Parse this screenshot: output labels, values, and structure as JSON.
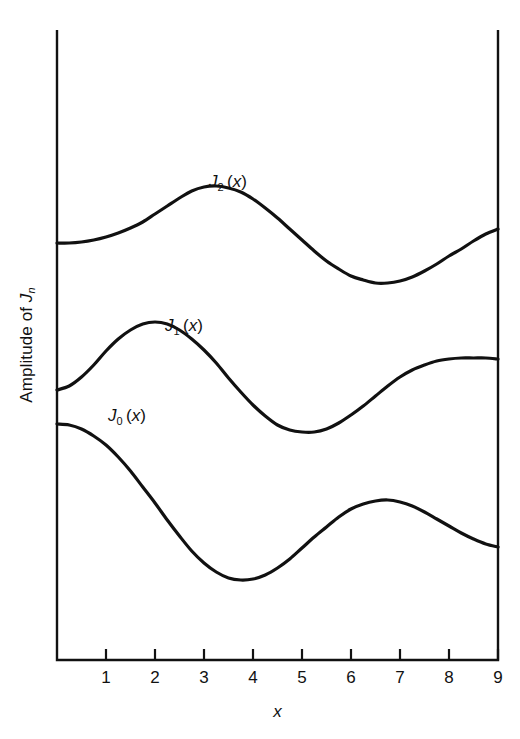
{
  "chart_data": {
    "type": "line",
    "title": "",
    "xlabel": "x",
    "ylabel": "Amplitude of J",
    "ylabel_sub": "n",
    "xlim": [
      0,
      9.0
    ],
    "ylim": [
      -1.0,
      1.0
    ],
    "grid": false,
    "legend": "inline-curve-labels",
    "xticks": [
      "1",
      "2",
      "3",
      "4",
      "5",
      "6",
      "7",
      "8",
      "9"
    ],
    "xtick_values": [
      1,
      2,
      3,
      4,
      5,
      6,
      7,
      8,
      9
    ],
    "yticks": [],
    "axis_style": "box-left-bottom-right",
    "line_color": "#111111",
    "line_width_px": 3.2,
    "background_color": "#ffffff",
    "series": [
      {
        "name": "J_2(x)",
        "label": "J",
        "label_sub": "2",
        "label_suffix": "(x)",
        "label_position": {
          "x_px": 209,
          "y_px": 172
        },
        "x": [
          0.0,
          0.25,
          0.5,
          0.75,
          1.0,
          1.25,
          1.5,
          1.75,
          2.0,
          2.25,
          2.5,
          2.75,
          3.0,
          3.25,
          3.5,
          3.75,
          4.0,
          4.25,
          4.5,
          4.75,
          5.0,
          5.25,
          5.5,
          5.75,
          6.0,
          6.25,
          6.5,
          6.75,
          7.0,
          7.25,
          7.5,
          7.75,
          8.0,
          8.25,
          8.5,
          8.75,
          9.0
        ],
        "y_px": [
          243,
          243,
          242,
          240,
          237,
          233,
          228,
          222,
          214,
          206,
          198,
          191,
          187,
          186,
          188,
          192,
          199,
          208,
          218,
          229,
          240,
          251,
          261,
          269,
          276,
          280,
          283,
          283,
          281,
          277,
          271,
          264,
          256,
          249,
          241,
          234,
          229
        ]
      },
      {
        "name": "J_1(x)",
        "label": "J",
        "label_sub": "1",
        "label_suffix": "(x)",
        "label_position": {
          "x_px": 165,
          "y_px": 316
        },
        "x": [
          0.0,
          0.25,
          0.5,
          0.75,
          1.0,
          1.25,
          1.5,
          1.75,
          2.0,
          2.25,
          2.5,
          2.75,
          3.0,
          3.25,
          3.5,
          3.75,
          4.0,
          4.25,
          4.5,
          4.75,
          5.0,
          5.25,
          5.5,
          5.75,
          6.0,
          6.25,
          6.5,
          6.75,
          7.0,
          7.25,
          7.5,
          7.75,
          8.0,
          8.25,
          8.5,
          8.75,
          9.0
        ],
        "y_px": [
          390,
          386,
          377,
          365,
          351,
          339,
          330,
          324,
          322,
          324,
          330,
          339,
          350,
          363,
          378,
          392,
          405,
          416,
          425,
          430,
          432,
          432,
          429,
          423,
          415,
          406,
          396,
          386,
          377,
          370,
          365,
          361,
          359,
          358,
          358,
          358,
          359
        ]
      },
      {
        "name": "J_0(x)",
        "label": "J",
        "label_sub": "0",
        "label_suffix": "(x)",
        "label_position": {
          "x_px": 108,
          "y_px": 406
        },
        "x": [
          0.0,
          0.25,
          0.5,
          0.75,
          1.0,
          1.25,
          1.5,
          1.75,
          2.0,
          2.25,
          2.5,
          2.75,
          3.0,
          3.25,
          3.5,
          3.75,
          4.0,
          4.25,
          4.5,
          4.75,
          5.0,
          5.25,
          5.5,
          5.75,
          6.0,
          6.25,
          6.5,
          6.75,
          7.0,
          7.25,
          7.5,
          7.75,
          8.0,
          8.25,
          8.5,
          8.75,
          9.0
        ],
        "y_px": [
          424,
          425,
          429,
          436,
          445,
          457,
          471,
          487,
          503,
          520,
          536,
          551,
          563,
          572,
          578,
          580,
          579,
          575,
          568,
          559,
          548,
          537,
          527,
          517,
          509,
          504,
          501,
          500,
          502,
          506,
          512,
          519,
          526,
          533,
          539,
          544,
          547
        ]
      }
    ]
  },
  "figure": {
    "plot_area": {
      "left_px": 57,
      "top_px": 30,
      "right_px": 498,
      "bottom_px": 660
    },
    "tick_length_px": 11
  }
}
